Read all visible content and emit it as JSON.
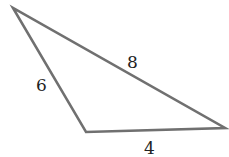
{
  "diagram": {
    "type": "triangle",
    "stroke_color": "#707070",
    "vertices": [
      {
        "x": 13,
        "y": 8
      },
      {
        "x": 86,
        "y": 132
      },
      {
        "x": 225,
        "y": 128
      }
    ],
    "side_labels": [
      {
        "side": "top-left to right",
        "text": "8"
      },
      {
        "side": "top-left to bottom-left",
        "text": "6"
      },
      {
        "side": "bottom-left to right",
        "text": "4"
      }
    ]
  }
}
